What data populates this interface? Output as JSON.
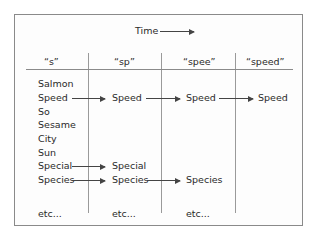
{
  "title": "Time",
  "columns": [
    "“s”",
    "“sp”",
    "“spee”",
    "“speed”"
  ],
  "col1": [
    "Salmon",
    "Speed",
    "So",
    "Sesame",
    "City",
    "Sun",
    "Special",
    "Species",
    "etc..."
  ],
  "col2": {
    "speed": "Speed",
    "special": "Special",
    "species": "Species",
    "etc": "etc..."
  },
  "col3": {
    "speed": "Speed",
    "species": "Species",
    "etc": "etc..."
  },
  "col4": {
    "speed": "Speed"
  }
}
